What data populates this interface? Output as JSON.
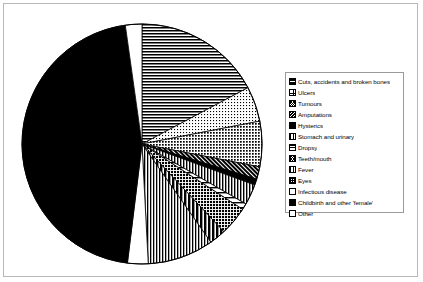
{
  "figure": {
    "background_color": "#ffffff",
    "frame_color": "#b8b8b8",
    "legend_border_color": "#9a9a9a"
  },
  "legend": {
    "position": "right",
    "items": [
      {
        "label": "Cuts, accidents and broken bones",
        "pattern": "hlines"
      },
      {
        "label": "Ulcers",
        "pattern": "dots-light"
      },
      {
        "label": "Tumours",
        "pattern": "crosshatch-gray"
      },
      {
        "label": "Amputations",
        "pattern": "diag-dark"
      },
      {
        "label": "Hysterics",
        "pattern": "solid-black"
      },
      {
        "label": "Stomach and urinary",
        "pattern": "vlines"
      },
      {
        "label": "Dropsy",
        "pattern": "hlines-wide"
      },
      {
        "label": "Teeth/mouth",
        "pattern": "crosshatch-dark"
      },
      {
        "label": "Fever",
        "pattern": "vlines-wide"
      },
      {
        "label": "Eyes",
        "pattern": "grid"
      },
      {
        "label": "Infectious disease",
        "pattern": "white"
      },
      {
        "label": "Childbirth and other 'female'",
        "pattern": "solid-black"
      },
      {
        "label": "Other",
        "pattern": "white"
      }
    ]
  },
  "chart_data": {
    "type": "pie",
    "title": "",
    "start_angle_deg": 0,
    "direction": "clockwise",
    "units": "degrees",
    "center_px": [
      138,
      140
    ],
    "radius_px": 120,
    "categories": [
      "Cuts, accidents and broken bones",
      "Ulcers",
      "Tumours",
      "Amputations",
      "Hysterics",
      "Stomach and urinary",
      "Dropsy",
      "Teeth/mouth",
      "Fever",
      "Eyes",
      "Infectious disease",
      "Childbirth and other 'female'",
      "Other"
    ],
    "angles_deg": [
      62,
      17,
      22,
      6,
      3,
      10,
      3,
      14,
      8,
      32,
      10,
      165,
      8
    ],
    "values_percent": [
      17.2,
      4.7,
      6.1,
      1.7,
      0.8,
      2.8,
      0.8,
      3.9,
      2.2,
      8.9,
      2.8,
      45.8,
      2.2
    ],
    "patterns": [
      "hlines",
      "dots-light",
      "crosshatch-gray",
      "diag-dark",
      "solid-black",
      "vlines",
      "hlines-wide",
      "crosshatch-dark",
      "vlines-wide",
      "grid",
      "white",
      "solid-black",
      "white"
    ],
    "legend": [
      "Cuts, accidents and broken bones",
      "Ulcers",
      "Tumours",
      "Amputations",
      "Hysterics",
      "Stomach and urinary",
      "Dropsy",
      "Teeth/mouth",
      "Fever",
      "Eyes",
      "Infectious disease",
      "Childbirth and other 'female'",
      "Other"
    ],
    "legend_position": "right",
    "grid": false,
    "xlabel": "",
    "ylabel": ""
  }
}
